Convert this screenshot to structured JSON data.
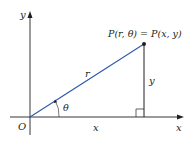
{
  "diagram": {
    "labels": {
      "y_axis": "y",
      "x_axis": "x",
      "origin": "O",
      "point": "P(r, θ) = P(x, y)",
      "radius": "r",
      "angle": "θ",
      "horizontal_leg": "x",
      "vertical_leg": "y"
    },
    "colors": {
      "axes": "#231f20",
      "radius_line": "#2b59a8",
      "legs": "#231f20",
      "background": "#ffffff"
    }
  }
}
